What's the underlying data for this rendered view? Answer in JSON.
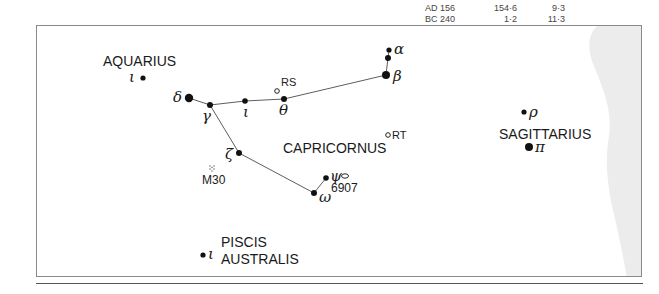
{
  "table_fragment": {
    "rows": [
      {
        "epoch": "AD 156",
        "value1": "154·6",
        "value2": "9·3"
      },
      {
        "epoch": "BC 240",
        "value1": "1·2",
        "value2": "11·3"
      }
    ]
  },
  "chart": {
    "constellation_labels": {
      "aquarius": "AQUARIUS",
      "capricornus": "CAPRICORNUS",
      "sagittarius": "SAGITTARIUS",
      "piscis_line1": "PISCIS",
      "piscis_line2": "AUSTRALIS"
    },
    "stars": [
      {
        "id": "aqr-iota",
        "greek": "ι",
        "x": 106,
        "y": 52,
        "r": 2.6
      },
      {
        "id": "cap-delta",
        "greek": "δ",
        "x": 152,
        "y": 72,
        "r": 4.2
      },
      {
        "id": "cap-gamma",
        "greek": "γ",
        "x": 173,
        "y": 79,
        "r": 3
      },
      {
        "id": "cap-iota",
        "greek": "ι",
        "x": 208,
        "y": 75,
        "r": 2.8
      },
      {
        "id": "cap-theta",
        "greek": "θ",
        "x": 247,
        "y": 73,
        "r": 3
      },
      {
        "id": "cap-alpha1",
        "greek": "α",
        "x": 352,
        "y": 24,
        "r": 2.6
      },
      {
        "id": "cap-alpha2",
        "greek": "",
        "x": 351,
        "y": 32,
        "r": 3
      },
      {
        "id": "cap-beta",
        "greek": "β",
        "x": 349,
        "y": 49,
        "r": 4
      },
      {
        "id": "cap-zeta",
        "greek": "ζ",
        "x": 202,
        "y": 127,
        "r": 3
      },
      {
        "id": "cap-psi",
        "greek": "ψ",
        "x": 289,
        "y": 152,
        "r": 2.8
      },
      {
        "id": "cap-omega",
        "greek": "ω",
        "x": 277,
        "y": 167,
        "r": 3
      },
      {
        "id": "sgr-rho",
        "greek": "ρ",
        "x": 487,
        "y": 86,
        "r": 2.6
      },
      {
        "id": "sgr-pi",
        "greek": "π",
        "x": 492,
        "y": 121,
        "r": 4
      },
      {
        "id": "psa-iota",
        "greek": "ι",
        "x": 166,
        "y": 229,
        "r": 2.6
      }
    ],
    "variable_stars": [
      {
        "label": "RS",
        "x": 240,
        "y": 65
      },
      {
        "label": "RT",
        "x": 351,
        "y": 109
      }
    ],
    "deep_sky": [
      {
        "label": "M30",
        "type": "globular-cluster",
        "x": 175,
        "y": 143
      },
      {
        "label": "6907",
        "type": "galaxy",
        "x": 308,
        "y": 150
      }
    ],
    "lines": [
      [
        [
          152,
          72
        ],
        [
          173,
          79
        ]
      ],
      [
        [
          173,
          79
        ],
        [
          208,
          75
        ]
      ],
      [
        [
          208,
          75
        ],
        [
          247,
          73
        ]
      ],
      [
        [
          247,
          73
        ],
        [
          349,
          49
        ]
      ],
      [
        [
          349,
          49
        ],
        [
          351,
          32
        ]
      ],
      [
        [
          351,
          32
        ],
        [
          352,
          24
        ]
      ],
      [
        [
          173,
          79
        ],
        [
          202,
          127
        ]
      ],
      [
        [
          202,
          127
        ],
        [
          277,
          167
        ]
      ],
      [
        [
          277,
          167
        ],
        [
          289,
          152
        ]
      ]
    ],
    "milky_way_color": "#ececec"
  }
}
